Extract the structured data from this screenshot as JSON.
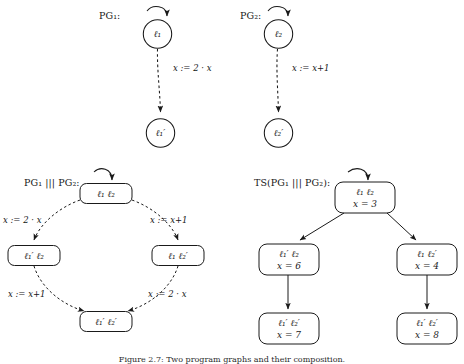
{
  "figure": {
    "caption": "Figure 2.7: Two program graphs and their composition."
  },
  "panels": {
    "pg1": {
      "title": "PG₁:",
      "nodes": [
        {
          "name": "pg1-node-l1",
          "label": "ℓ₁"
        },
        {
          "name": "pg1-node-l1-prime",
          "label": "ℓ₁′"
        }
      ],
      "edge_label": "x := 2 · x"
    },
    "pg2": {
      "title": "PG₂:",
      "nodes": [
        {
          "name": "pg2-node-l2",
          "label": "ℓ₂"
        },
        {
          "name": "pg2-node-l2-prime",
          "label": "ℓ₂′"
        }
      ],
      "edge_label": "x := x+1"
    },
    "composition": {
      "title": "PG₁ ||| PG₂:",
      "nodes": [
        {
          "name": "comp-node-top",
          "label": "ℓ₁ ℓ₂"
        },
        {
          "name": "comp-node-left",
          "label": "ℓ₁′ ℓ₂"
        },
        {
          "name": "comp-node-right",
          "label": "ℓ₁ ℓ₂′"
        },
        {
          "name": "comp-node-bottom",
          "label": "ℓ₁′ ℓ₂′"
        }
      ],
      "edge_labels": {
        "top_left": "x := 2 · x",
        "top_right": "x := x+1",
        "bottom_left": "x := x+1",
        "bottom_right": "x := 2 · x"
      }
    },
    "transition_system": {
      "title": "TS(PG₁ ||| PG₂):",
      "nodes": [
        {
          "name": "ts-node-root",
          "location": "ℓ₁ ℓ₂",
          "valuation": "x = 3"
        },
        {
          "name": "ts-node-left",
          "location": "ℓ₁′ ℓ₂",
          "valuation": "x = 6"
        },
        {
          "name": "ts-node-right",
          "location": "ℓ₁ ℓ₂′",
          "valuation": "x = 4"
        },
        {
          "name": "ts-node-left-leaf",
          "location": "ℓ₁′ ℓ₂′",
          "valuation": "x = 7"
        },
        {
          "name": "ts-node-right-leaf",
          "location": "ℓ₁′ ℓ₂′",
          "valuation": "x = 8"
        }
      ]
    }
  },
  "style": {
    "stroke": "#1a1a1a",
    "background": "#ffffff"
  }
}
